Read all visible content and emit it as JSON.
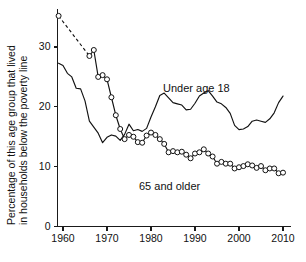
{
  "chart_data": {
    "type": "line",
    "title": "",
    "subtitle": "",
    "xlabel": "",
    "ylabel": "Percentage of this age group that lived in households below the poverty line",
    "ylabel_line1": "Percentage of this age group that lived",
    "ylabel_line2": "in households below the poverty line",
    "xlim": [
      1959,
      2010
    ],
    "ylim": [
      0,
      36
    ],
    "xticks": [
      1960,
      1970,
      1980,
      1990,
      2000,
      2010
    ],
    "xtick_labels": [
      "1960",
      "1970",
      "1980",
      "1990",
      "2000",
      "2010"
    ],
    "yticks": [
      0,
      10,
      20,
      30
    ],
    "ytick_labels": [
      "0",
      "10",
      "20",
      "30"
    ],
    "grid": false,
    "legend_position": "inline-annotations",
    "annotations": [
      {
        "text": "Under age 18",
        "x": 1983,
        "y": 24.6
      },
      {
        "text": "65 and older",
        "x": 1987,
        "y": 6.5
      }
    ],
    "series": [
      {
        "name": "Under age 18",
        "style": "solid-line",
        "marker": "none",
        "x": [
          1959,
          1960,
          1961,
          1962,
          1963,
          1964,
          1965,
          1966,
          1967,
          1968,
          1969,
          1970,
          1971,
          1972,
          1973,
          1974,
          1975,
          1976,
          1977,
          1978,
          1979,
          1980,
          1981,
          1982,
          1983,
          1984,
          1985,
          1986,
          1987,
          1988,
          1989,
          1990,
          1991,
          1992,
          1993,
          1994,
          1995,
          1996,
          1997,
          1998,
          1999,
          2000,
          2001,
          2002,
          2003,
          2004,
          2005,
          2006,
          2007,
          2008,
          2009,
          2010
        ],
        "values": [
          27.3,
          26.9,
          25.6,
          25.0,
          23.1,
          23.0,
          21.0,
          17.6,
          16.6,
          15.6,
          14.0,
          14.9,
          15.3,
          15.1,
          14.4,
          15.4,
          17.1,
          16.0,
          16.2,
          15.9,
          16.4,
          18.3,
          20.0,
          21.9,
          22.3,
          21.5,
          20.7,
          20.5,
          20.3,
          19.5,
          19.6,
          20.6,
          21.8,
          22.3,
          22.7,
          21.8,
          20.8,
          20.5,
          19.9,
          18.9,
          16.9,
          16.2,
          16.3,
          16.7,
          17.6,
          17.8,
          17.6,
          17.4,
          18.0,
          19.0,
          20.7,
          21.8
        ]
      },
      {
        "name": "65 and older",
        "style": "open-circle-markers",
        "marker": "circle",
        "gap_note": "dashed connector between 1959 and 1966 (no annual data 1960-1965)",
        "x": [
          1959,
          1966,
          1967,
          1968,
          1969,
          1970,
          1971,
          1972,
          1973,
          1974,
          1975,
          1976,
          1977,
          1978,
          1979,
          1980,
          1981,
          1982,
          1983,
          1984,
          1985,
          1986,
          1987,
          1988,
          1989,
          1990,
          1991,
          1992,
          1993,
          1994,
          1995,
          1996,
          1997,
          1998,
          1999,
          2000,
          2001,
          2002,
          2003,
          2004,
          2005,
          2006,
          2007,
          2008,
          2009,
          2010
        ],
        "values": [
          35.2,
          28.5,
          29.5,
          25.0,
          25.3,
          24.6,
          21.6,
          18.6,
          16.3,
          14.6,
          15.3,
          15.0,
          14.1,
          14.0,
          15.2,
          15.7,
          15.3,
          14.6,
          13.8,
          12.4,
          12.6,
          12.4,
          12.5,
          12.0,
          11.4,
          12.2,
          12.4,
          12.9,
          12.2,
          11.7,
          10.5,
          10.8,
          10.5,
          10.5,
          9.7,
          9.9,
          10.1,
          10.4,
          10.2,
          9.8,
          10.1,
          9.4,
          9.7,
          9.7,
          8.9,
          9.0
        ]
      }
    ]
  },
  "axis": {
    "ylabel_line1": "Percentage of this age group that lived",
    "ylabel_line2": "in households below the poverty line"
  },
  "labels": {
    "under18": "Under age 18",
    "older65": "65 and older"
  },
  "ticks": {
    "y": [
      "30",
      "20",
      "10",
      "0"
    ],
    "x": [
      "1960",
      "1970",
      "1980",
      "1990",
      "2000",
      "2010"
    ]
  }
}
